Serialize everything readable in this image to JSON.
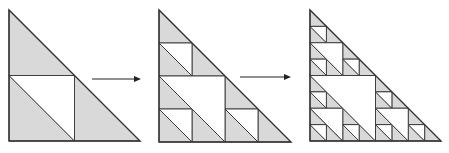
{
  "diagram": {
    "colors": {
      "fill": "#d9d9d9",
      "stroke": "#333333",
      "background": "#ffffff",
      "arrow": "#222222"
    },
    "stages": [
      {
        "label": "stage-1",
        "depth": 1,
        "x": 9,
        "y": 10,
        "size": 131
      },
      {
        "label": "stage-2",
        "depth": 2,
        "x": 159,
        "y": 10,
        "size": 132
      },
      {
        "label": "stage-3",
        "depth": 3,
        "x": 310,
        "y": 10,
        "size": 131
      }
    ],
    "arrows": [
      {
        "label": "arrow-1",
        "x1": 92,
        "x2": 141,
        "y": 79
      },
      {
        "label": "arrow-2",
        "x1": 240,
        "x2": 291,
        "y": 77
      }
    ]
  }
}
